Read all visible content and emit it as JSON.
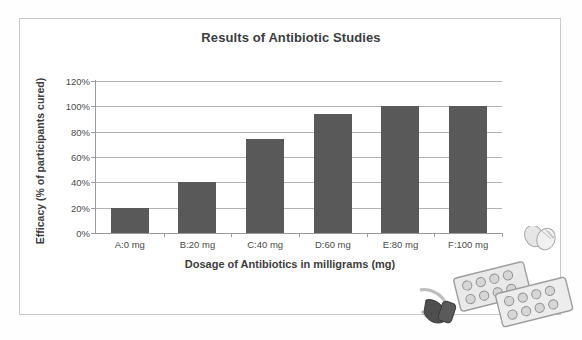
{
  "chart_data": {
    "type": "bar",
    "title": "Results of Antibiotic Studies",
    "xlabel": "Dosage of Antibiotics in milligrams (mg)",
    "ylabel": "Efficacy (% of participants cured)",
    "categories": [
      "A:0 mg",
      "B:20 mg",
      "C:40 mg",
      "D:60 mg",
      "E:80 mg",
      "F:100 mg"
    ],
    "values": [
      20,
      40,
      74,
      94,
      100,
      100
    ],
    "ylim": [
      0,
      120
    ],
    "ytick_labels": [
      "0%",
      "20%",
      "40%",
      "60%",
      "80%",
      "100%",
      "120%"
    ],
    "ytick_values": [
      0,
      20,
      40,
      60,
      80,
      100,
      120
    ],
    "grid": true,
    "legend": "none",
    "bar_color": "#595959",
    "gridline_color": "#b2b2b2",
    "axis_color": "#9a9a9a",
    "text_color": "#3d3d3d"
  },
  "decoration": {
    "artwork_label": "pill-blister-packs-and-capsules-illustration"
  }
}
